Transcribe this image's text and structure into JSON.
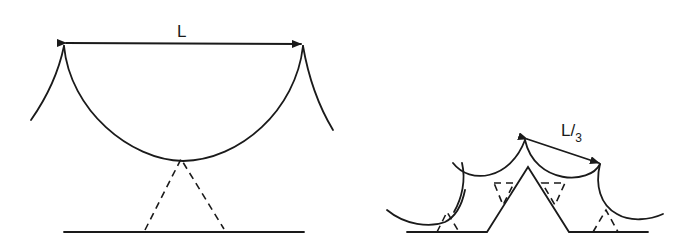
{
  "figure_left": {
    "span_label": "L",
    "description": "Single large circular-arc facet spanning length L above a dashed triangular support"
  },
  "figure_right": {
    "span_label_main": "L/",
    "span_label_sub": "3",
    "description": "Smaller arc facets of span L/3 on a faceted surface with dashed triangular supports"
  },
  "colors": {
    "ink": "#1a1a1a",
    "background": "#ffffff"
  }
}
